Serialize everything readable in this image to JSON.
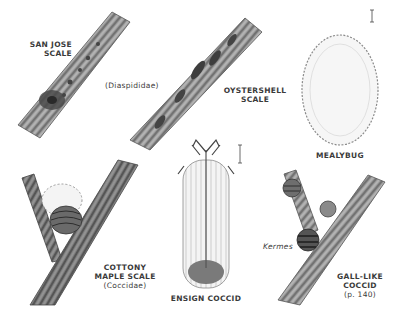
{
  "plate": {
    "background": "#ffffff",
    "ink_color": "#3a3a3a",
    "specimens": [
      {
        "name": "san-jose-scale",
        "label_lines": [
          "SAN JOSE",
          "SCALE"
        ]
      },
      {
        "name": "diaspididae",
        "label_lines": [
          "(Diaspididae)"
        ]
      },
      {
        "name": "oystershell-scale",
        "label_lines": [
          "OYSTERSHELL",
          "SCALE"
        ]
      },
      {
        "name": "mealybug",
        "label_lines": [
          "MEALYBUG"
        ]
      },
      {
        "name": "cottony-maple-scale",
        "label_lines": [
          "COTTONY",
          "MAPLE SCALE",
          "(Coccidae)"
        ]
      },
      {
        "name": "ensign-coccid",
        "label_lines": [
          "ENSIGN COCCID"
        ]
      },
      {
        "name": "kermes",
        "label_lines": [
          "Kermes"
        ]
      },
      {
        "name": "gall-like-coccid",
        "label_lines": [
          "GALL-LIKE",
          "COCCID",
          "(p. 140)"
        ]
      }
    ]
  }
}
